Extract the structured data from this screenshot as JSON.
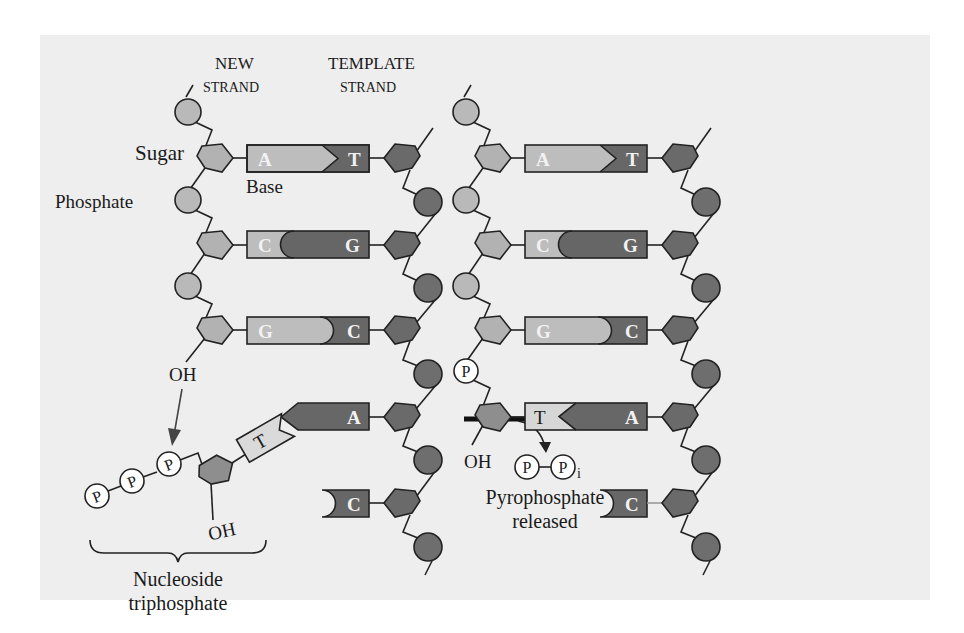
{
  "labels": {
    "new_strand_1": "NEW",
    "new_strand_2": "STRAND",
    "template_strand_1": "TEMPLATE",
    "template_strand_2": "STRAND",
    "sugar": "Sugar",
    "base": "Base",
    "phosphate": "Phosphate",
    "oh_top": "OH",
    "oh_bottom": "OH",
    "oh_right": "OH",
    "nucleoside_1": "Nucleoside",
    "nucleoside_2": "triphosphate",
    "pyro_1": "Pyrophosphate",
    "pyro_2": "released",
    "p_symbol": "P",
    "pi_subscript": "i"
  },
  "left_pairs": [
    {
      "new": "A",
      "template": "T"
    },
    {
      "new": "C",
      "template": "G"
    },
    {
      "new": "G",
      "template": "C"
    },
    {
      "new": "T",
      "template": "A"
    },
    {
      "new": "",
      "template": "C"
    }
  ],
  "right_pairs": [
    {
      "new": "A",
      "template": "T"
    },
    {
      "new": "C",
      "template": "G"
    },
    {
      "new": "G",
      "template": "C"
    },
    {
      "new": "T",
      "template": "A"
    },
    {
      "new": "",
      "template": "C"
    }
  ],
  "colors": {
    "background": "#eeeeee",
    "new_strand_fill": "#b9b9b9",
    "template_fill": "#6e6e6e",
    "base_light": "#bdbdbd",
    "base_dark": "#676767",
    "incoming_base": "#dadada",
    "outline": "#222222"
  }
}
